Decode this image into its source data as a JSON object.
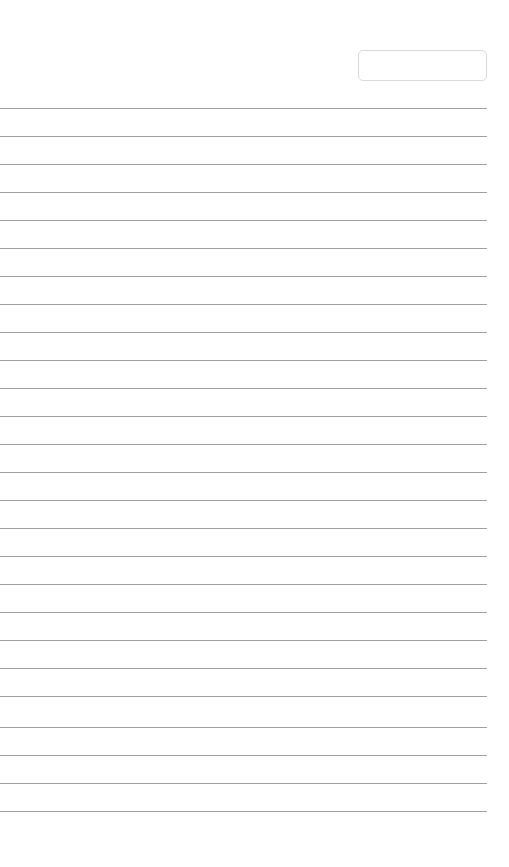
{
  "page": {
    "name": "lined-note-page",
    "background_color": "#ffffff",
    "width": 509,
    "height": 867
  },
  "header": {
    "title_field": {
      "name": "title-input",
      "value": "",
      "placeholder": "",
      "left": 358,
      "top": 50,
      "width": 129,
      "height": 31,
      "border_color": "#d9d9d9",
      "border_radius": 5
    }
  },
  "ruling": {
    "line_color": "#8e8e92",
    "line_thickness": 1,
    "line_left": 0,
    "line_width": 487,
    "first_line_y": 108,
    "line_spacing": 28,
    "line_count": 26,
    "lines_y": [
      108,
      136,
      164,
      192,
      220,
      248,
      276,
      304,
      332,
      360,
      388,
      416,
      444,
      472,
      500,
      528,
      556,
      584,
      612,
      640,
      668,
      696,
      727,
      755,
      783,
      811
    ]
  },
  "body": {
    "text_lines": []
  }
}
